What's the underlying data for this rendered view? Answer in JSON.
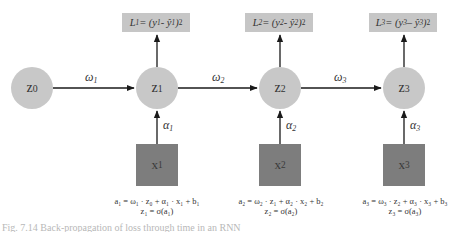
{
  "diagram": {
    "type": "recurrent-network-unrolled",
    "nodes": [
      {
        "id": "z0",
        "base": "z",
        "sub": "0"
      },
      {
        "id": "z1",
        "base": "z",
        "sub": "1"
      },
      {
        "id": "z2",
        "base": "z",
        "sub": "2"
      },
      {
        "id": "z3",
        "base": "z",
        "sub": "3"
      }
    ],
    "inputs": [
      {
        "id": "x1",
        "base": "x",
        "sub": "1"
      },
      {
        "id": "x2",
        "base": "x",
        "sub": "2"
      },
      {
        "id": "x3",
        "base": "x",
        "sub": "3"
      }
    ],
    "losses": [
      {
        "L": "L",
        "i": "1",
        "expr_mid": " = (y",
        "expr_hat": " - ŷ",
        "close": ")",
        "pow": "2"
      },
      {
        "L": "L",
        "i": "2",
        "expr_mid": " = (y",
        "expr_hat": " - ŷ",
        "close": ")",
        "pow": "2"
      },
      {
        "L": "L",
        "i": "3",
        "expr_mid": " = (y",
        "expr_hat": " – ŷ",
        "close": ")",
        "pow": "2"
      }
    ],
    "weights": [
      {
        "sym": "ω",
        "sub": "1"
      },
      {
        "sym": "ω",
        "sub": "2"
      },
      {
        "sym": "ω",
        "sub": "3"
      }
    ],
    "input_weights": [
      {
        "sym": "α",
        "sub": "1"
      },
      {
        "sym": "α",
        "sub": "2"
      },
      {
        "sym": "α",
        "sub": "3"
      }
    ],
    "equations": [
      {
        "line1": "a₁ = ω₁ · z₀ + α₁ · x₁ + b₁",
        "line2": "z₁ = σ(a₁)"
      },
      {
        "line1": "a₂ = ω₂ · z₁ + α₂ · x₂ + b₂",
        "line2": "z₂ = σ(a₂)"
      },
      {
        "line1": "a₃ = ω₃ · z₂ + α₃ · x₃ + b₃",
        "line2": "z₃ = σ(a₃)"
      }
    ],
    "colors": {
      "node_fill": "#c8c8c8",
      "loss_fill": "#c6c6c6",
      "input_fill": "#7d7d7d",
      "arrow": "#1a1a1a"
    }
  },
  "caption": "Fig. 7.14 Back-propagation of loss through time in an RNN"
}
